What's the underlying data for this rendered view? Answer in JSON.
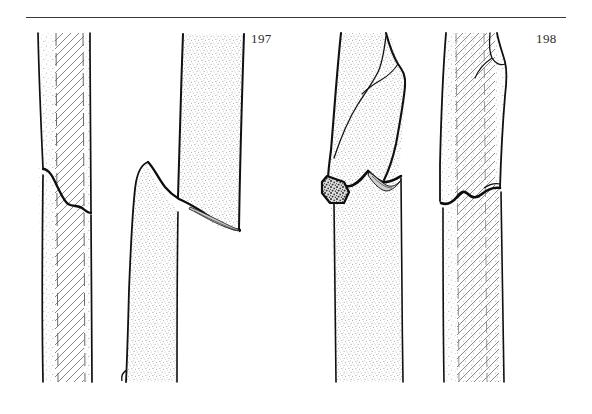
{
  "plate": {
    "kind": "line-drawing-plate",
    "title": "",
    "background_color": "#ffffff",
    "ink_color": "#111111",
    "rule": {
      "name": "top-horizontal-rule",
      "x": 26,
      "y": 17,
      "width": 540,
      "color": "#3a3a3a"
    },
    "figures": [
      {
        "number": "197",
        "label_position": {
          "x": 251,
          "y": 31
        },
        "caption": "",
        "specimens": [
          {
            "name": "stem-197-left",
            "description": "straight stem with stippled band and diagonal hatched core, low oblique fracture near base",
            "fill_patterns": [
              "stipple",
              "diagonal-hatch",
              "dashed-edge"
            ]
          },
          {
            "name": "stem-197-right",
            "description": "stem with long oblique spiral break; detached lower fragment leaning left, stippled fill",
            "fill_patterns": [
              "stipple"
            ]
          }
        ]
      },
      {
        "number": "198",
        "label_position": {
          "x": 536,
          "y": 31
        },
        "caption": "",
        "specimens": [
          {
            "name": "stem-198-left",
            "description": "stem snapped and displaced sideways; dark textured break face at lower left, zigzag break line",
            "fill_patterns": [
              "stipple",
              "dark-texture"
            ]
          },
          {
            "name": "stem-198-right",
            "description": "stem with diagonal hatched core and stipple margin; step-shaped transverse break near mid height; small notch at top right",
            "fill_patterns": [
              "stipple",
              "diagonal-hatch",
              "dashed-edge"
            ]
          }
        ]
      }
    ],
    "numbers": {
      "fig_197": "197",
      "fig_198": "198"
    }
  }
}
